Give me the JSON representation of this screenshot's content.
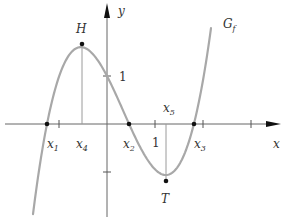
{
  "figure": {
    "type": "function-graph",
    "graph_label": "G",
    "graph_label_sub": "f",
    "axes": {
      "x_label": "x",
      "y_label": "y",
      "unit_label_x": "1",
      "unit_label_y": "1"
    },
    "points": {
      "high": {
        "label": "H",
        "x": -0.52,
        "y": 1.67
      },
      "low": {
        "label": "T",
        "x": 1.23,
        "y": -1.19
      }
    },
    "x_markers": [
      {
        "name": "x1",
        "base": "x",
        "sub": "1",
        "x": -1.25
      },
      {
        "name": "x4",
        "base": "x",
        "sub": "4",
        "x": -0.52
      },
      {
        "name": "x2",
        "base": "x",
        "sub": "2",
        "x": 0.46
      },
      {
        "name": "x5",
        "base": "x",
        "sub": "5",
        "x": 1.23
      },
      {
        "name": "x3",
        "base": "x",
        "sub": "3",
        "x": 1.81
      }
    ],
    "colors": {
      "curve": "#a8a8a8",
      "axis": "#555555",
      "guide": "#9a9a9a",
      "point": "#111111",
      "text": "#333333"
    }
  }
}
